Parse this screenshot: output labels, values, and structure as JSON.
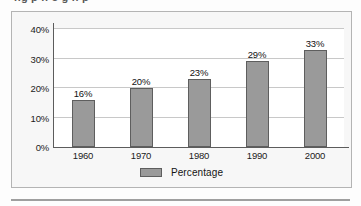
{
  "page": {
    "clipped_header_text": "ng p  n   o  g     n   p",
    "background_color": "#fdfdfd"
  },
  "figure": {
    "frame_border_color": "#b4b4b4",
    "frame_background_color": "#f7f7f7"
  },
  "chart_data": {
    "type": "bar",
    "title": "",
    "xlabel": "",
    "ylabel": "",
    "categories": [
      "1960",
      "1970",
      "1980",
      "1990",
      "2000"
    ],
    "values": [
      16,
      23,
      26,
      33,
      37
    ],
    "value_labels": [
      "16%",
      "20%",
      "23%",
      "29%",
      "33%"
    ],
    "series": [
      {
        "name": "Percentage",
        "values": [
          16,
          20,
          23,
          29,
          33
        ],
        "color": "#9a9a9a"
      }
    ],
    "ylim": [
      0,
      40
    ],
    "yticks": [
      0,
      10,
      20,
      30,
      40
    ],
    "ytick_labels": [
      "0%",
      "10%",
      "20%",
      "30%",
      "40%"
    ],
    "grid": true,
    "grid_axis": "y",
    "grid_color": "#c8c8c8",
    "legend_position": "bottom-center",
    "legend": [
      "Percentage"
    ],
    "bar_fill_color": "#9a9a9a",
    "bar_border_color": "#5e5e5e",
    "axis_color": "#5c5c5c",
    "plot_background_color": "#ffffff"
  },
  "legend": {
    "label": "Percentage",
    "swatch_color": "#9a9a9a"
  }
}
